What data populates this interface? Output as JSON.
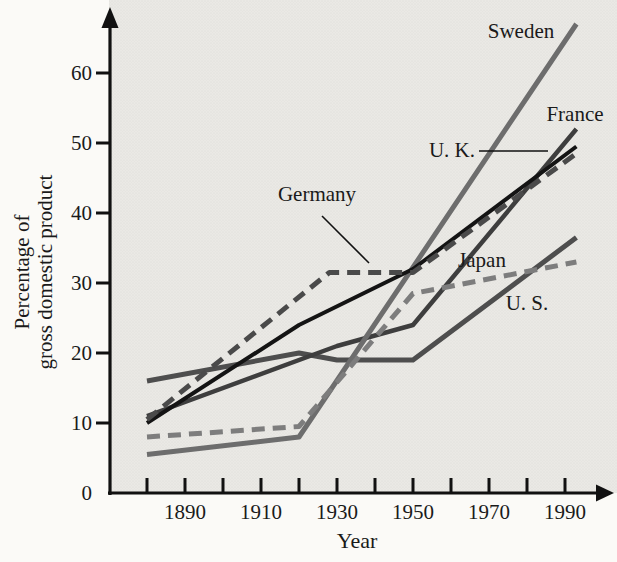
{
  "chart_data": {
    "type": "line",
    "title": "",
    "xlabel": "Year",
    "ylabel": "Percentage of gross domestic product",
    "ylabel_lines": [
      "Percentage of",
      "gross domestic product"
    ],
    "x_ticks_all": [
      1880,
      1890,
      1900,
      1910,
      1920,
      1930,
      1940,
      1950,
      1960,
      1970,
      1980,
      1990
    ],
    "x_tick_labels": [
      "1890",
      "1910",
      "1930",
      "1950",
      "1970",
      "1990"
    ],
    "x_tick_label_years": [
      1890,
      1910,
      1930,
      1950,
      1970,
      1990
    ],
    "y_ticks": [
      0,
      10,
      20,
      30,
      40,
      50,
      60
    ],
    "x_range": [
      1880,
      1993
    ],
    "y_range": [
      0,
      70
    ],
    "grid": false,
    "legend_position": "inline-labels",
    "series": [
      {
        "name": "U. S.",
        "style": "solid",
        "color": "#4e4e4e",
        "points": [
          [
            1880,
            16
          ],
          [
            1920,
            20
          ],
          [
            1930,
            19
          ],
          [
            1950,
            19
          ],
          [
            1993,
            36.5
          ]
        ]
      },
      {
        "name": "France",
        "style": "solid",
        "color": "#3e3e3e",
        "points": [
          [
            1880,
            11
          ],
          [
            1930,
            21
          ],
          [
            1950,
            24
          ],
          [
            1993,
            52
          ]
        ]
      },
      {
        "name": "Sweden",
        "style": "solid",
        "color": "#6d6d6d",
        "points": [
          [
            1880,
            5.5
          ],
          [
            1920,
            8
          ],
          [
            1993,
            67
          ]
        ]
      },
      {
        "name": "Japan",
        "style": "dashed",
        "color": "#7d7d7d",
        "points": [
          [
            1880,
            8
          ],
          [
            1920,
            9.5
          ],
          [
            1950,
            28.5
          ],
          [
            1993,
            33
          ]
        ]
      },
      {
        "name": "U. K.",
        "style": "solid",
        "color": "#141414",
        "points": [
          [
            1880,
            10
          ],
          [
            1920,
            24
          ],
          [
            1950,
            32
          ],
          [
            1993,
            49.5
          ]
        ]
      },
      {
        "name": "Germany",
        "style": "dashed",
        "color": "#4a4a4a",
        "points": [
          [
            1880,
            10.5
          ],
          [
            1928,
            31.5
          ],
          [
            1950,
            31.5
          ],
          [
            1993,
            48.5
          ]
        ]
      }
    ]
  }
}
